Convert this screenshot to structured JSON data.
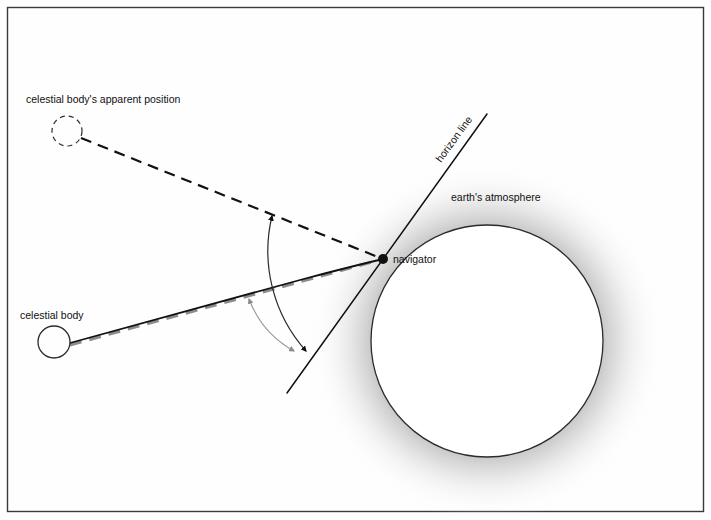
{
  "figure": {
    "background_color": "#fefefe",
    "border_color": "#3a3a3a"
  },
  "labels": {
    "apparent_position": "celestial body's apparent position",
    "celestial_body": "celestial body",
    "navigator": "navigator",
    "horizon_line": "horizon line",
    "earths_atmosphere": "earth's atmosphere"
  },
  "colors": {
    "line_black": "#111111",
    "line_gray": "#8c8c8c",
    "atmosphere_gray": "#b9b9b9",
    "earth_outline": "#2b2b2b",
    "earth_fill": "#ffffff",
    "border": "#3a3a3a"
  },
  "geometry": {
    "navigator_point": {
      "x": 383,
      "y": 259,
      "r": 5
    },
    "apparent_body_circle": {
      "x": 67,
      "y": 131,
      "r": 15,
      "style": "dashed"
    },
    "celestial_body_circle": {
      "x": 54,
      "y": 342,
      "r": 16,
      "style": "solid"
    },
    "earth_circle": {
      "x": 487,
      "y": 341,
      "r": 116
    },
    "atmosphere_outer_r": 180,
    "horizon_line": {
      "x1": 487,
      "y1": 114,
      "x2": 287,
      "y2": 393
    },
    "apparent_ray": {
      "x1": 81,
      "y1": 138,
      "x2": 383,
      "y2": 259,
      "style": "dashed-black"
    },
    "true_ray_straight": {
      "x1": 69,
      "y1": 345,
      "x2": 383,
      "y2": 259,
      "style": "dashed-gray"
    },
    "refracted_ray": {
      "x1": 69,
      "y1": 343,
      "x2": 383,
      "y2": 259,
      "style": "solid-curved-black"
    },
    "apparent_altitude_arc": {
      "from": [
        272,
        214
      ],
      "to": [
        307,
        353
      ],
      "color": "#111111"
    },
    "true_altitude_arc": {
      "from": [
        248,
        297
      ],
      "to": [
        295,
        353
      ],
      "color": "#8c8c8c"
    }
  },
  "label_positions": {
    "apparent_position": {
      "x": 26,
      "y": 103
    },
    "celestial_body": {
      "x": 20,
      "y": 319
    },
    "navigator": {
      "x": 392,
      "y": 263
    },
    "horizon_line": {
      "x": 441,
      "y": 163,
      "rotation": -54
    },
    "earths_atmosphere": {
      "x": 451,
      "y": 201
    }
  }
}
